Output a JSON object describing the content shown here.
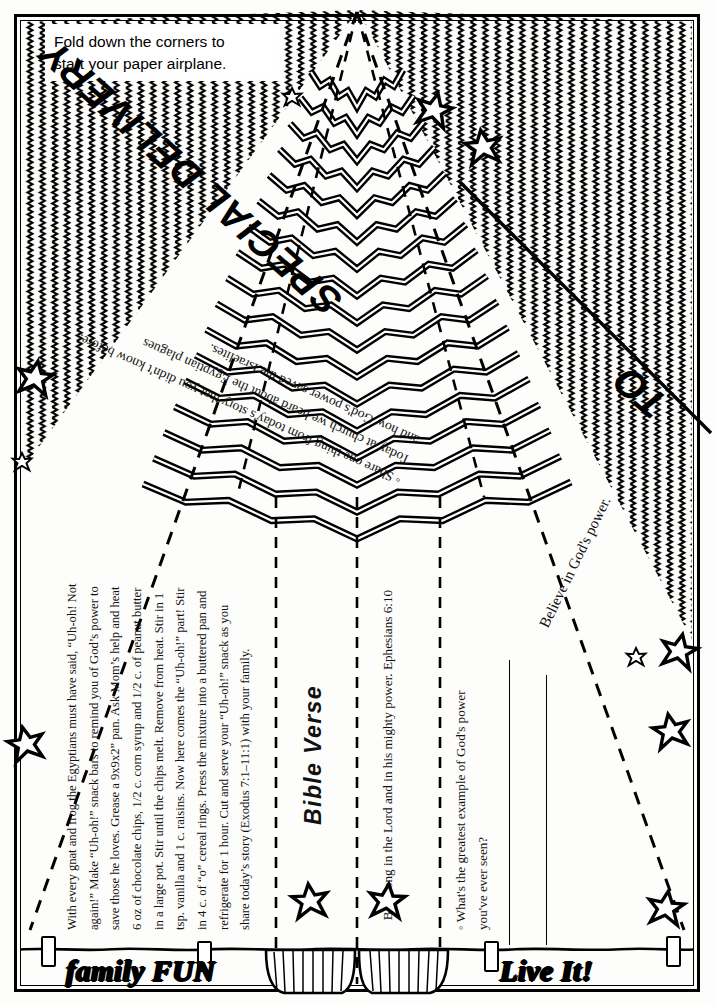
{
  "page": {
    "ink_color": "#000000",
    "paper_color": "#fdfdfb"
  },
  "fold_note": {
    "line1": "Fold down the corners to",
    "line2": "start your paper airplane."
  },
  "envelope": {
    "special_delivery": "SPECIAL DELIVERY",
    "to_label": "TO",
    "believe_line": "Believe in God's power."
  },
  "talk_about": {
    "line1": "◦ Share one thing from today's story that you didn't know before.",
    "line2": "Today at church we heard about the Egyptian plagues",
    "line3": "and how God's power saved the Israelites."
  },
  "recipe": {
    "body": "With every gnat and frog the Egyptians must have said, “Uh-oh! Not again!” Make “Uh-oh!” snack bars to remind you of God’s power to save those he loves. Grease a 9x9x2” pan. Ask Mom’s help and heat 6 oz of chocolate chips, 1/2 c. corn syrup and 1/2 c. of peanut butter in a large pot. Stir until the chips melt. Remove from heat. Stir in 1 tsp. vanilla and 1 c. raisins. Now here comes the “Uh-oh!” part! Stir in 4 c. of “o” cereal rings. Press the mixture into a buttered pan and refrigerate for 1 hour. Cut and serve your “Uh-oh!” snack as you share today’s story (Exodus 7:1–11:1) with your family."
  },
  "bible_verse": {
    "title": "Bible Verse",
    "text": "Be strong in the Lord and in his mighty power. Ephesians 6:10"
  },
  "question": {
    "bullet": "◦ What's the greatest example of God's power",
    "line2": "you've ever seen?",
    "answer_lines": 2
  },
  "banner": {
    "family_fun": "family FUN",
    "live_it": "Live It!",
    "clips": 4,
    "stars_left": 4,
    "stars_right": 5,
    "streamers": 2
  },
  "decor": {
    "star_glyph": "star-burst",
    "zigzag_fill": "squiggle-lines",
    "chevron_rows": 17,
    "fold_lines": 4
  }
}
